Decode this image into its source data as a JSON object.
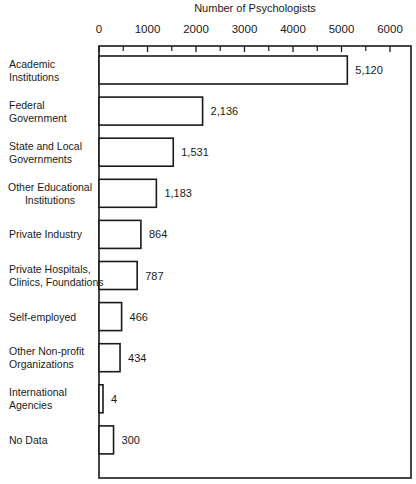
{
  "chart_data": {
    "type": "bar",
    "orientation": "horizontal",
    "title": "",
    "xlabel": "Number of Psychologists",
    "ylabel": "",
    "xlim": [
      0,
      6500
    ],
    "x_ticks": [
      0,
      1000,
      2000,
      3000,
      4000,
      5000,
      6000
    ],
    "x_minor_ticks": [
      500,
      1500,
      2500,
      3500,
      4500,
      5500
    ],
    "x_tick_labels": [
      "0",
      "1000",
      "2000",
      "3000",
      "4000",
      "5000",
      "6000"
    ],
    "x_axis_position": "top",
    "grid": false,
    "legend": "none",
    "categories": [
      [
        "Academic",
        "Institutions"
      ],
      [
        "Federal",
        "Government"
      ],
      [
        "State and Local",
        "Governments"
      ],
      [
        "Other Educational",
        "Institutions"
      ],
      [
        "Private Industry"
      ],
      [
        "Private Hospitals,",
        "Clinics, Foundations"
      ],
      [
        "Self-employed"
      ],
      [
        "Other Non-profit",
        "Organizations"
      ],
      [
        "International",
        "Agencies"
      ],
      [
        "No Data"
      ]
    ],
    "values": [
      5120,
      2136,
      1531,
      1183,
      864,
      787,
      466,
      434,
      4,
      300
    ],
    "value_labels": [
      "5,120",
      "2,136",
      "1,531",
      "1,183",
      "864",
      "787",
      "466",
      "434",
      "4",
      "300"
    ]
  }
}
